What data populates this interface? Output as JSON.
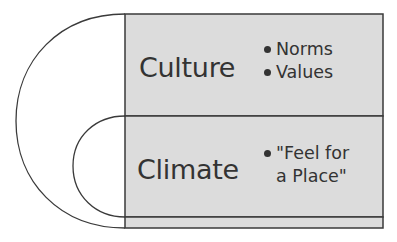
{
  "diagram": {
    "colors": {
      "box_fill": "#dcdcdc",
      "stroke": "#3a3a3a",
      "text": "#333333"
    },
    "sections": [
      {
        "title": "Culture",
        "bullets": [
          "Norms",
          "Values"
        ]
      },
      {
        "title": "Climate",
        "bullets": [
          "\"Feel for",
          "a Place\""
        ]
      }
    ]
  }
}
